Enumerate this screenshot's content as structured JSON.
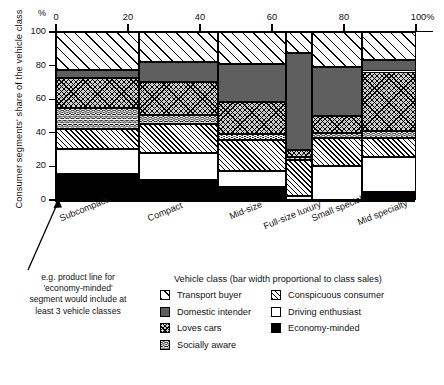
{
  "chart_data": {
    "type": "bar",
    "subtype": "100% stacked bar, variable bar width (marimekko / mekko)",
    "title": "",
    "ylabel": "Consumer segments' share of the vehicle class",
    "ylabel_unit": "%",
    "xlabel": "Vehicle class (bar width proportional to class sales)",
    "ylim": [
      0,
      100
    ],
    "xlim": [
      0,
      100
    ],
    "yticks": [
      0,
      20,
      40,
      60,
      80,
      100
    ],
    "ytick_labels": [
      "0",
      "20",
      "40",
      "60",
      "80",
      "100"
    ],
    "xticks": [
      0,
      20,
      40,
      60,
      80,
      100
    ],
    "xtick_labels": [
      "0",
      "20",
      "40",
      "60",
      "80",
      "100%"
    ],
    "grid": false,
    "legend_position": "bottom-right",
    "categories": [
      "Subcompact",
      "Compact",
      "Mid-size",
      "Full-size luxury",
      "Small specialty",
      "Mid specialty"
    ],
    "category_widths_pct": [
      23,
      22,
      19,
      7,
      14,
      15
    ],
    "category_bounds_pct": [
      [
        0,
        23
      ],
      [
        23,
        45
      ],
      [
        45,
        64
      ],
      [
        64,
        71
      ],
      [
        71,
        85
      ],
      [
        85,
        100
      ]
    ],
    "series": [
      {
        "name": "Economy-minded",
        "pattern": "solid-black",
        "values": [
          15.5,
          12,
          8,
          0,
          0,
          4.5
        ]
      },
      {
        "name": "Driving enthusiast",
        "pattern": "solid-white",
        "values": [
          15,
          16,
          9,
          2.5,
          20,
          21
        ]
      },
      {
        "name": "Conspicuous consumer",
        "pattern": "dense-diagonal",
        "values": [
          11.5,
          17.5,
          18.5,
          21.5,
          17,
          11.5
        ]
      },
      {
        "name": "Socially aware",
        "pattern": "wavy",
        "values": [
          13,
          5,
          4,
          1.5,
          3,
          4
        ]
      },
      {
        "name": "Loves cars",
        "pattern": "cross-hatch",
        "values": [
          17.5,
          19.5,
          19,
          4.5,
          10,
          35.5
        ]
      },
      {
        "name": "Domestic intender",
        "pattern": "solid-grey",
        "values": [
          5,
          12,
          22.5,
          57.5,
          29,
          7
        ]
      },
      {
        "name": "Transport buyer",
        "pattern": "wide-diagonal",
        "values": [
          22.5,
          18,
          19,
          12.5,
          21,
          16.5
        ]
      }
    ]
  },
  "axis": {
    "corner_unit": "%",
    "y_title": "Consumer segments' share of the vehicle class"
  },
  "annotation": {
    "lines": [
      "e.g. product line for",
      "'economy-minded'",
      "segment would include at",
      "least 3 vehicle classes"
    ]
  },
  "legend": {
    "title": "Vehicle class (bar width proportional to class sales)",
    "columns": [
      [
        {
          "label": "Transport buyer",
          "swatch": "wide-diagonal"
        },
        {
          "label": "Domestic intender",
          "swatch": "solid-grey"
        },
        {
          "label": "Loves cars",
          "swatch": "cross-hatch"
        },
        {
          "label": "Socially aware",
          "swatch": "wavy"
        }
      ],
      [
        {
          "label": "Conspicuous consumer",
          "swatch": "dense-diagonal"
        },
        {
          "label": "Driving enthusiast",
          "swatch": "solid-white"
        },
        {
          "label": "Economy-minded",
          "swatch": "solid-black"
        }
      ]
    ]
  },
  "colors": {
    "ink": "#000000",
    "grey_fill": "#5f5f5f",
    "crosshatch_bg": "#cfcfcf",
    "paper": "#ffffff"
  }
}
